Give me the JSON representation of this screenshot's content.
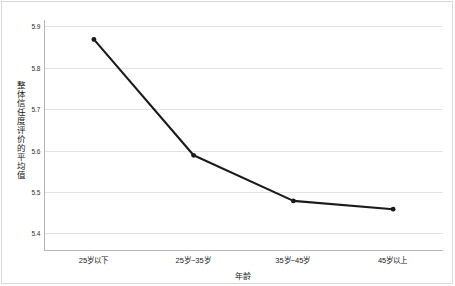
{
  "chart_data": {
    "type": "line",
    "title": "",
    "xlabel": "年龄",
    "ylabel": "整体信任度评价的平均值",
    "categories": [
      "25岁以下",
      "25岁~35岁",
      "35岁~45岁",
      "45岁以上"
    ],
    "values": [
      5.87,
      5.59,
      5.48,
      5.46
    ],
    "series": [
      {
        "name": "整体信任度评价的平均值",
        "values": [
          5.87,
          5.59,
          5.48,
          5.46
        ]
      }
    ],
    "ylim": [
      5.4,
      5.9
    ],
    "yticks": [
      "5.9",
      "5.8",
      "5.7",
      "5.6",
      "5.5",
      "5.4"
    ],
    "ytick_values": [
      5.9,
      5.8,
      5.7,
      5.6,
      5.5,
      5.4
    ],
    "grid": true,
    "legend": false,
    "legend_position": "none",
    "line_color": "#1a1a1a",
    "marker": "circle",
    "marker_color": "#1a1a1a",
    "gridline_color": "#e3e3e3",
    "axis_color": "#b5b5b5",
    "frame_color": "#d9d9d9",
    "background": "#ffffff"
  },
  "axes": {
    "y_title": "整体信任度评价的平均值",
    "x_title": "年龄"
  }
}
